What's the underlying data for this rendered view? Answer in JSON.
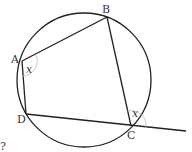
{
  "diagram": {
    "type": "cyclic-quadrilateral",
    "circle": {
      "cx": 84,
      "cy": 80,
      "r": 67
    },
    "points": {
      "A": {
        "label": "A",
        "x": 22,
        "y": 61
      },
      "B": {
        "label": "B",
        "x": 107,
        "y": 17
      },
      "C": {
        "label": "C",
        "x": 131,
        "y": 126
      },
      "D": {
        "label": "D",
        "x": 26,
        "y": 114
      }
    },
    "extension_end": {
      "x": 186,
      "y": 131
    },
    "angle_labels": {
      "at_A": "x",
      "at_C_exterior": "x"
    },
    "stray_mark": "?",
    "colors": {
      "stroke": "#222222",
      "arc": "#bbbbbb",
      "text": "#333333"
    }
  }
}
